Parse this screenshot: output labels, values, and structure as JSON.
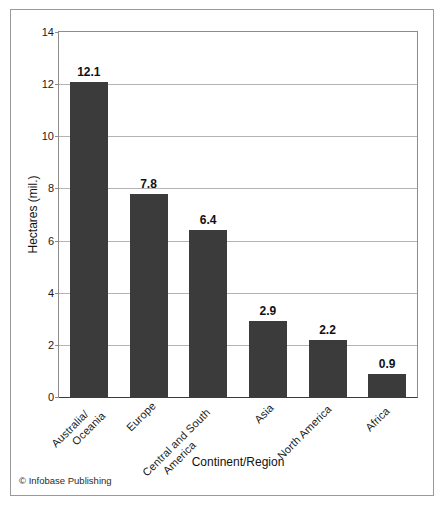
{
  "figure": {
    "credit": "© Infobase Publishing"
  },
  "chart_data": {
    "type": "bar",
    "title": "",
    "xlabel": "Continent/Region",
    "ylabel": "Hectares (mil.)",
    "categories": [
      "Australia/ Oceania",
      "Europe",
      "Central and South America",
      "Asia",
      "North America",
      "Africa"
    ],
    "category_lines": [
      [
        "Australia/",
        "Oceania"
      ],
      [
        "Europe"
      ],
      [
        "Central and South",
        "America"
      ],
      [
        "Asia"
      ],
      [
        "North America"
      ],
      [
        "Africa"
      ]
    ],
    "values": [
      12.1,
      7.8,
      6.4,
      2.9,
      2.2,
      0.9
    ],
    "value_labels": [
      "12.1",
      "7.8",
      "6.4",
      "2.9",
      "2.2",
      "0.9"
    ],
    "ylim": [
      0,
      14
    ],
    "ytick_values": [
      14,
      12,
      10,
      8,
      6,
      4,
      2,
      0
    ],
    "ytick_labels": [
      "14",
      "12",
      "10",
      "8",
      "6",
      "4",
      "2",
      "0"
    ],
    "grid": true,
    "legend": false,
    "bar_color": "#3b3b3b",
    "label_rotation": -45
  }
}
